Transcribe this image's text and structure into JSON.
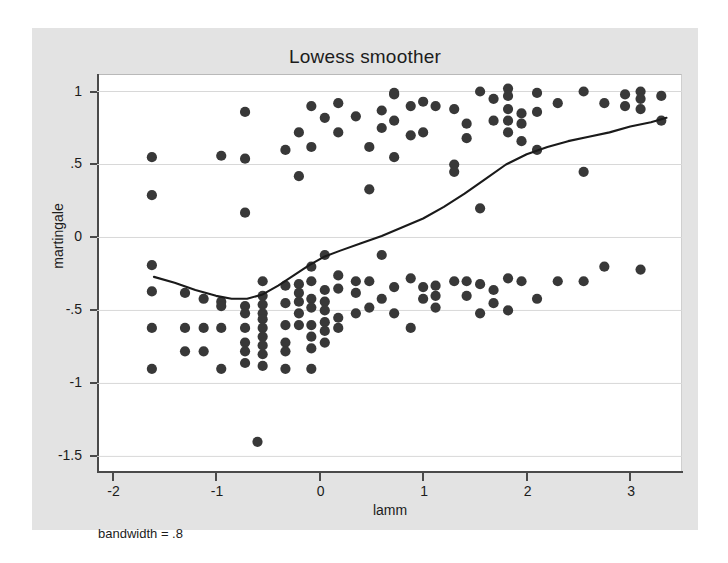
{
  "chart_data": {
    "type": "scatter",
    "title": "Lowess smoother",
    "xlabel": "lamm",
    "ylabel": "martingale",
    "annotation": "bandwidth = .8",
    "grid": true,
    "legend": false,
    "xlim": [
      -2.15,
      3.5
    ],
    "ylim": [
      -1.6,
      1.12
    ],
    "xticks": [
      -2,
      -1,
      0,
      1,
      2,
      3
    ],
    "xticklabels": [
      "-2",
      "-1",
      "0",
      "1",
      "2",
      "3"
    ],
    "yticks": [
      1,
      0.5,
      0,
      -0.5,
      -1,
      -1.5
    ],
    "yticklabels": [
      "1",
      ".5",
      "0",
      "-.5",
      "-1",
      "-1.5"
    ],
    "marker_color": "#383838",
    "line_color": "#1a1a1a",
    "points": [
      [
        -1.62,
        0.55
      ],
      [
        -1.62,
        0.29
      ],
      [
        -1.62,
        -0.19
      ],
      [
        -1.62,
        -0.37
      ],
      [
        -1.62,
        -0.62
      ],
      [
        -1.62,
        -0.9
      ],
      [
        -1.3,
        -0.38
      ],
      [
        -1.3,
        -0.62
      ],
      [
        -1.3,
        -0.78
      ],
      [
        -1.12,
        -0.42
      ],
      [
        -1.12,
        -0.62
      ],
      [
        -1.12,
        -0.78
      ],
      [
        -0.95,
        0.56
      ],
      [
        -0.95,
        -0.44
      ],
      [
        -0.95,
        -0.47
      ],
      [
        -0.95,
        -0.62
      ],
      [
        -0.95,
        -0.9
      ],
      [
        -0.72,
        0.86
      ],
      [
        -0.72,
        0.54
      ],
      [
        -0.72,
        0.17
      ],
      [
        -0.72,
        -0.47
      ],
      [
        -0.72,
        -0.52
      ],
      [
        -0.72,
        -0.62
      ],
      [
        -0.72,
        -0.72
      ],
      [
        -0.72,
        -0.78
      ],
      [
        -0.72,
        -0.86
      ],
      [
        -0.6,
        -1.4
      ],
      [
        -0.55,
        -0.3
      ],
      [
        -0.55,
        -0.4
      ],
      [
        -0.55,
        -0.46
      ],
      [
        -0.55,
        -0.52
      ],
      [
        -0.55,
        -0.56
      ],
      [
        -0.55,
        -0.62
      ],
      [
        -0.55,
        -0.68
      ],
      [
        -0.55,
        -0.74
      ],
      [
        -0.55,
        -0.8
      ],
      [
        -0.55,
        -0.88
      ],
      [
        -0.33,
        0.6
      ],
      [
        -0.33,
        -0.33
      ],
      [
        -0.33,
        -0.45
      ],
      [
        -0.33,
        -0.6
      ],
      [
        -0.33,
        -0.72
      ],
      [
        -0.33,
        -0.78
      ],
      [
        -0.33,
        -0.9
      ],
      [
        -0.2,
        0.72
      ],
      [
        -0.2,
        0.42
      ],
      [
        -0.2,
        -0.32
      ],
      [
        -0.2,
        -0.38
      ],
      [
        -0.2,
        -0.44
      ],
      [
        -0.2,
        -0.52
      ],
      [
        -0.2,
        -0.6
      ],
      [
        -0.08,
        0.9
      ],
      [
        -0.08,
        0.62
      ],
      [
        -0.08,
        -0.2
      ],
      [
        -0.08,
        -0.3
      ],
      [
        -0.08,
        -0.42
      ],
      [
        -0.08,
        -0.48
      ],
      [
        -0.08,
        -0.6
      ],
      [
        -0.08,
        -0.68
      ],
      [
        -0.08,
        -0.76
      ],
      [
        -0.08,
        -0.9
      ],
      [
        0.05,
        0.82
      ],
      [
        0.05,
        -0.12
      ],
      [
        0.05,
        -0.36
      ],
      [
        0.05,
        -0.44
      ],
      [
        0.05,
        -0.5
      ],
      [
        0.05,
        -0.58
      ],
      [
        0.05,
        -0.64
      ],
      [
        0.05,
        -0.72
      ],
      [
        0.18,
        0.92
      ],
      [
        0.18,
        0.72
      ],
      [
        0.18,
        -0.26
      ],
      [
        0.18,
        -0.35
      ],
      [
        0.18,
        -0.55
      ],
      [
        0.18,
        -0.62
      ],
      [
        0.35,
        0.83
      ],
      [
        0.35,
        -0.3
      ],
      [
        0.35,
        -0.38
      ],
      [
        0.35,
        -0.52
      ],
      [
        0.48,
        0.62
      ],
      [
        0.48,
        0.33
      ],
      [
        0.48,
        -0.3
      ],
      [
        0.48,
        -0.48
      ],
      [
        0.6,
        0.87
      ],
      [
        0.6,
        0.75
      ],
      [
        0.6,
        -0.12
      ],
      [
        0.6,
        -0.42
      ],
      [
        0.72,
        0.99
      ],
      [
        0.72,
        0.98
      ],
      [
        0.72,
        0.8
      ],
      [
        0.72,
        0.55
      ],
      [
        0.72,
        -0.34
      ],
      [
        0.72,
        -0.52
      ],
      [
        0.88,
        0.9
      ],
      [
        0.88,
        0.7
      ],
      [
        0.88,
        -0.28
      ],
      [
        0.88,
        -0.62
      ],
      [
        1.0,
        0.93
      ],
      [
        1.0,
        0.72
      ],
      [
        1.0,
        -0.34
      ],
      [
        1.0,
        -0.42
      ],
      [
        1.12,
        0.9
      ],
      [
        1.12,
        -0.33
      ],
      [
        1.12,
        -0.4
      ],
      [
        1.12,
        -0.48
      ],
      [
        1.3,
        0.88
      ],
      [
        1.3,
        0.5
      ],
      [
        1.3,
        0.45
      ],
      [
        1.3,
        -0.3
      ],
      [
        1.42,
        0.78
      ],
      [
        1.42,
        0.68
      ],
      [
        1.42,
        -0.3
      ],
      [
        1.42,
        -0.4
      ],
      [
        1.55,
        1.0
      ],
      [
        1.55,
        0.2
      ],
      [
        1.55,
        -0.32
      ],
      [
        1.55,
        -0.52
      ],
      [
        1.68,
        0.95
      ],
      [
        1.68,
        0.8
      ],
      [
        1.68,
        -0.36
      ],
      [
        1.68,
        -0.45
      ],
      [
        1.82,
        1.02
      ],
      [
        1.82,
        0.97
      ],
      [
        1.82,
        0.88
      ],
      [
        1.82,
        0.8
      ],
      [
        1.82,
        0.72
      ],
      [
        1.82,
        -0.28
      ],
      [
        1.82,
        -0.5
      ],
      [
        1.95,
        0.85
      ],
      [
        1.95,
        0.78
      ],
      [
        1.95,
        0.66
      ],
      [
        1.95,
        -0.3
      ],
      [
        2.1,
        0.99
      ],
      [
        2.1,
        0.86
      ],
      [
        2.1,
        0.6
      ],
      [
        2.1,
        -0.42
      ],
      [
        2.3,
        0.92
      ],
      [
        2.3,
        -0.3
      ],
      [
        2.55,
        1.0
      ],
      [
        2.55,
        0.45
      ],
      [
        2.55,
        -0.3
      ],
      [
        2.75,
        0.92
      ],
      [
        2.75,
        -0.2
      ],
      [
        2.95,
        0.98
      ],
      [
        2.95,
        0.9
      ],
      [
        3.1,
        1.0
      ],
      [
        3.1,
        0.95
      ],
      [
        3.1,
        0.88
      ],
      [
        3.1,
        -0.22
      ],
      [
        3.3,
        0.97
      ],
      [
        3.3,
        0.8
      ]
    ],
    "lowess": [
      [
        -1.6,
        -0.27
      ],
      [
        -1.4,
        -0.31
      ],
      [
        -1.2,
        -0.36
      ],
      [
        -1.0,
        -0.4
      ],
      [
        -0.85,
        -0.42
      ],
      [
        -0.7,
        -0.42
      ],
      [
        -0.55,
        -0.39
      ],
      [
        -0.4,
        -0.33
      ],
      [
        -0.25,
        -0.26
      ],
      [
        -0.1,
        -0.19
      ],
      [
        0.05,
        -0.13
      ],
      [
        0.2,
        -0.09
      ],
      [
        0.4,
        -0.04
      ],
      [
        0.6,
        0.01
      ],
      [
        0.8,
        0.07
      ],
      [
        1.0,
        0.13
      ],
      [
        1.2,
        0.21
      ],
      [
        1.4,
        0.3
      ],
      [
        1.6,
        0.4
      ],
      [
        1.8,
        0.5
      ],
      [
        2.0,
        0.57
      ],
      [
        2.2,
        0.62
      ],
      [
        2.4,
        0.66
      ],
      [
        2.6,
        0.69
      ],
      [
        2.8,
        0.72
      ],
      [
        3.0,
        0.76
      ],
      [
        3.2,
        0.79
      ],
      [
        3.35,
        0.82
      ]
    ]
  }
}
